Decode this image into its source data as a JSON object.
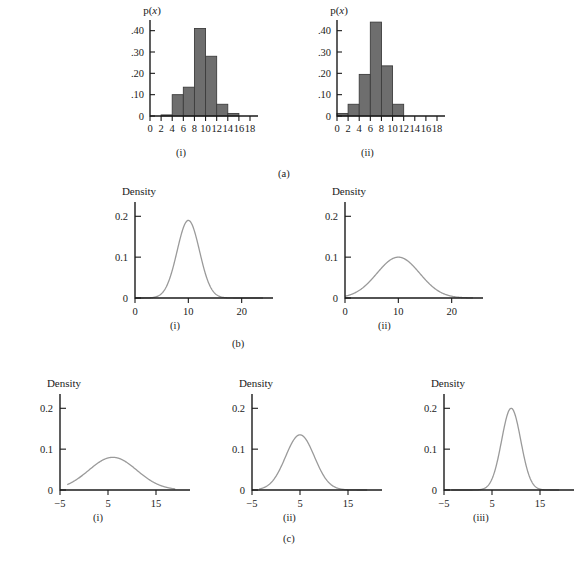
{
  "figure": {
    "row_captions": [
      {
        "id": "a",
        "label": "(a)"
      },
      {
        "id": "b",
        "label": "(b)"
      },
      {
        "id": "c",
        "label": "(c)"
      }
    ]
  },
  "chart_data": [
    {
      "id": "a-i",
      "type": "bar",
      "title": "",
      "panel_label": "(i)",
      "row": "(a)",
      "ylabel": "p(x)",
      "xlabel": "",
      "bin_width": 2,
      "bin_starts": [
        0,
        2,
        4,
        6,
        8,
        10,
        12,
        14,
        16
      ],
      "categories": [
        "0-2",
        "2-4",
        "4-6",
        "6-8",
        "8-10",
        "10-12",
        "12-14",
        "14-16",
        "16-18"
      ],
      "values": [
        0.0,
        0.005,
        0.1,
        0.135,
        0.41,
        0.28,
        0.055,
        0.012,
        0.0
      ],
      "xticks": [
        0,
        2,
        4,
        6,
        8,
        10,
        12,
        14,
        16,
        18
      ],
      "xtick_labels": [
        "0",
        "2",
        "4",
        "6",
        "8",
        "10",
        "12",
        "14",
        "16",
        "18"
      ],
      "yticks": [
        0,
        0.1,
        0.2,
        0.3,
        0.4
      ],
      "ytick_labels": [
        "0",
        ".10",
        ".20",
        ".30",
        ".40"
      ],
      "xlim": [
        0,
        18
      ],
      "ylim": [
        0,
        0.45
      ],
      "grid": false,
      "legend": "none",
      "bar_color": "#6e6e6e"
    },
    {
      "id": "a-ii",
      "type": "bar",
      "title": "",
      "panel_label": "(ii)",
      "row": "(a)",
      "ylabel": "p(x)",
      "xlabel": "",
      "bin_width": 2,
      "bin_starts": [
        0,
        2,
        4,
        6,
        8,
        10,
        12,
        14,
        16
      ],
      "categories": [
        "0-2",
        "2-4",
        "4-6",
        "6-8",
        "8-10",
        "10-12",
        "12-14",
        "14-16",
        "16-18"
      ],
      "values": [
        0.012,
        0.055,
        0.195,
        0.44,
        0.235,
        0.055,
        0.0,
        0.0,
        0.0
      ],
      "xticks": [
        0,
        2,
        4,
        6,
        8,
        10,
        12,
        14,
        16,
        18
      ],
      "xtick_labels": [
        "0",
        "2",
        "4",
        "6",
        "8",
        "10",
        "12",
        "14",
        "16",
        "18"
      ],
      "yticks": [
        0,
        0.1,
        0.2,
        0.3,
        0.4
      ],
      "ytick_labels": [
        "0",
        ".10",
        ".20",
        ".30",
        ".40"
      ],
      "xlim": [
        0,
        18
      ],
      "ylim": [
        0,
        0.45
      ],
      "grid": false,
      "legend": "none",
      "bar_color": "#6e6e6e"
    },
    {
      "id": "b-i",
      "type": "line",
      "title": "",
      "panel_label": "(i)",
      "row": "(b)",
      "ylabel": "Density",
      "xlabel": "",
      "distribution": {
        "kind": "normal",
        "mean": 10,
        "sd": 2.1,
        "peak": 0.19
      },
      "xticks": [
        0,
        10,
        20
      ],
      "xtick_labels": [
        "0",
        "10",
        "20"
      ],
      "yticks": [
        0,
        0.1,
        0.2
      ],
      "ytick_labels": [
        "0",
        "0.1",
        "0.2"
      ],
      "xlim": [
        0,
        24
      ],
      "ylim": [
        0,
        0.235
      ],
      "grid": false,
      "legend": "none",
      "line_color": "#9a9a9a"
    },
    {
      "id": "b-ii",
      "type": "line",
      "title": "",
      "panel_label": "(ii)",
      "row": "(b)",
      "ylabel": "Density",
      "xlabel": "",
      "distribution": {
        "kind": "normal",
        "mean": 10,
        "sd": 4.0,
        "peak": 0.1
      },
      "xticks": [
        0,
        10,
        20
      ],
      "xtick_labels": [
        "0",
        "10",
        "20"
      ],
      "yticks": [
        0,
        0.1,
        0.2
      ],
      "ytick_labels": [
        "0",
        "0.1",
        "0.2"
      ],
      "xlim": [
        0,
        24
      ],
      "ylim": [
        0,
        0.235
      ],
      "grid": false,
      "legend": "none",
      "line_color": "#9a9a9a"
    },
    {
      "id": "c-i",
      "type": "line",
      "title": "",
      "panel_label": "(i)",
      "row": "(c)",
      "ylabel": "Density",
      "xlabel": "",
      "distribution": {
        "kind": "normal",
        "mean": 6,
        "sd": 5.0,
        "peak": 0.08
      },
      "xticks": [
        -5,
        5,
        15
      ],
      "xtick_labels": [
        "−5",
        "5",
        "15"
      ],
      "yticks": [
        0,
        0.1,
        0.2
      ],
      "ytick_labels": [
        "0",
        "0.1",
        "0.2"
      ],
      "xlim": [
        -5,
        20
      ],
      "ylim": [
        0,
        0.235
      ],
      "grid": false,
      "legend": "none",
      "line_color": "#9a9a9a"
    },
    {
      "id": "c-ii",
      "type": "line",
      "title": "",
      "panel_label": "(ii)",
      "row": "(c)",
      "ylabel": "Density",
      "xlabel": "",
      "distribution": {
        "kind": "normal",
        "mean": 5,
        "sd": 3.0,
        "peak": 0.135
      },
      "xticks": [
        -5,
        5,
        15
      ],
      "xtick_labels": [
        "−5",
        "5",
        "15"
      ],
      "yticks": [
        0,
        0.1,
        0.2
      ],
      "ytick_labels": [
        "0",
        "0.1",
        "0.2"
      ],
      "xlim": [
        -5,
        20
      ],
      "ylim": [
        0,
        0.235
      ],
      "grid": false,
      "legend": "none",
      "line_color": "#9a9a9a"
    },
    {
      "id": "c-iii",
      "type": "line",
      "title": "",
      "panel_label": "(iii)",
      "row": "(c)",
      "ylabel": "Density",
      "xlabel": "",
      "distribution": {
        "kind": "normal",
        "mean": 9,
        "sd": 2.0,
        "peak": 0.2
      },
      "xticks": [
        -5,
        5,
        15
      ],
      "xtick_labels": [
        "−5",
        "5",
        "15"
      ],
      "yticks": [
        0,
        0.1,
        0.2
      ],
      "ytick_labels": [
        "0",
        "0.1",
        "0.2"
      ],
      "xlim": [
        -5,
        20
      ],
      "ylim": [
        0,
        0.235
      ],
      "grid": false,
      "legend": "none",
      "line_color": "#9a9a9a"
    }
  ]
}
